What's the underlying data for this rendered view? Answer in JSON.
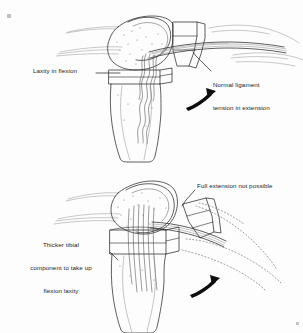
{
  "figure": {
    "style": "pen-and-ink line drawing",
    "background_color": "#fdfdfd",
    "ink_color": "#1a1a1a",
    "soft_tissue_color": "#8a8a8a",
    "panels": [
      {
        "id": "top-panel",
        "name": "flexion-laxity-panel",
        "description": "Knee in flexion with prosthetic femoral and tibial components; collateral ligament slack on the flexion side and taut in extension"
      },
      {
        "id": "bottom-panel",
        "name": "thicker-component-panel",
        "description": "Thicker tibial insert fills the flexion gap but blocks full extension; dotted outline shows unattainable extended position"
      }
    ]
  },
  "labels": {
    "laxity_in_flexion": "Laxity in flexion",
    "normal_ligament_line1": "Normal ligament",
    "normal_ligament_line2": "tension in extension",
    "thicker_tibial_line1": "Thicker tibial",
    "thicker_tibial_line2": "component to take up",
    "thicker_tibial_line3": "flexion laxity",
    "full_extension": "Full extension not possible"
  },
  "arrows": [
    {
      "name": "top-rotation-arrow",
      "direction": "up-right",
      "style": "solid-black-curved"
    },
    {
      "name": "bottom-rotation-arrow",
      "direction": "up-right",
      "style": "solid-black-curved"
    }
  ],
  "leader_lines": [
    {
      "name": "laxity-leader",
      "from": "Laxity in flexion",
      "to": "tibial component joint line"
    },
    {
      "name": "normal-ligament-leader",
      "from": "Normal ligament tension in extension",
      "to": "taut ligament band"
    },
    {
      "name": "thicker-tibial-leader",
      "from": "Thicker tibial component to take up flexion laxity",
      "to": "thicker tibial insert"
    },
    {
      "name": "full-extension-leader",
      "from": "Full extension not possible",
      "to": "dotted phantom tibia outline"
    }
  ]
}
